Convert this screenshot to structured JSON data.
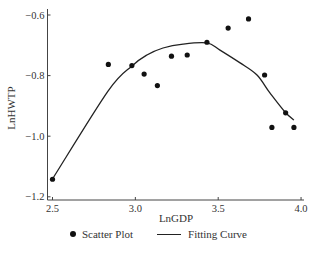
{
  "chart_data": {
    "type": "scatter",
    "title": "",
    "xlabel": "LnGDP",
    "ylabel": "LnHWTP",
    "xlim": [
      2.47,
      4.02
    ],
    "ylim": [
      -1.215,
      -0.58
    ],
    "x_ticks": [
      2.5,
      3.0,
      3.5,
      4.0
    ],
    "x_tick_labels": [
      "2.5",
      "3.0",
      "3.5",
      "4.0"
    ],
    "y_ticks": [
      -0.6,
      -0.8,
      -1.0,
      -1.2
    ],
    "y_tick_labels": [
      "−0.6",
      "−0.8",
      "−1.0",
      "−1.2"
    ],
    "grid": false,
    "legend_position": "bottom",
    "series": [
      {
        "name": "Scatter Plot",
        "type": "scatter",
        "color": "#111111",
        "x": [
          2.5,
          2.837,
          2.979,
          3.053,
          3.133,
          3.218,
          3.313,
          3.432,
          3.56,
          3.683,
          3.78,
          3.907,
          3.824,
          3.957
        ],
        "y": [
          -1.142,
          -0.763,
          -0.767,
          -0.795,
          -0.833,
          -0.736,
          -0.732,
          -0.69,
          -0.643,
          -0.613,
          -0.798,
          -0.923,
          -0.971,
          -0.971
        ]
      },
      {
        "name": "Fitting Curve",
        "type": "line",
        "color": "#222222",
        "x": [
          2.5,
          2.835,
          2.98,
          3.07,
          3.167,
          3.288,
          3.432,
          3.511,
          3.632,
          3.734,
          3.812,
          3.903,
          3.957
        ],
        "y": [
          -1.141,
          -0.851,
          -0.768,
          -0.732,
          -0.709,
          -0.696,
          -0.692,
          -0.716,
          -0.758,
          -0.798,
          -0.857,
          -0.92,
          -0.947
        ]
      }
    ]
  },
  "legend": {
    "items": [
      {
        "label": "Scatter Plot",
        "marker": "dot"
      },
      {
        "label": "Fitting Curve",
        "marker": "line"
      }
    ]
  }
}
